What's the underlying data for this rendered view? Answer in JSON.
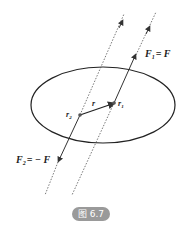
{
  "figure": {
    "caption": "图 6.7",
    "colors": {
      "line": "#222222",
      "dotted": "#555555",
      "caption_bg": "#9a9a9a"
    },
    "labels": {
      "F1": "F",
      "F1_sub": "1",
      "F1_rhs": "= F",
      "F2": "F",
      "F2_sub": "2",
      "F2_rhs": "= − F",
      "r": "r",
      "r1": "r",
      "r1_sub": "1",
      "r2": "r",
      "r2_sub": "2"
    }
  }
}
